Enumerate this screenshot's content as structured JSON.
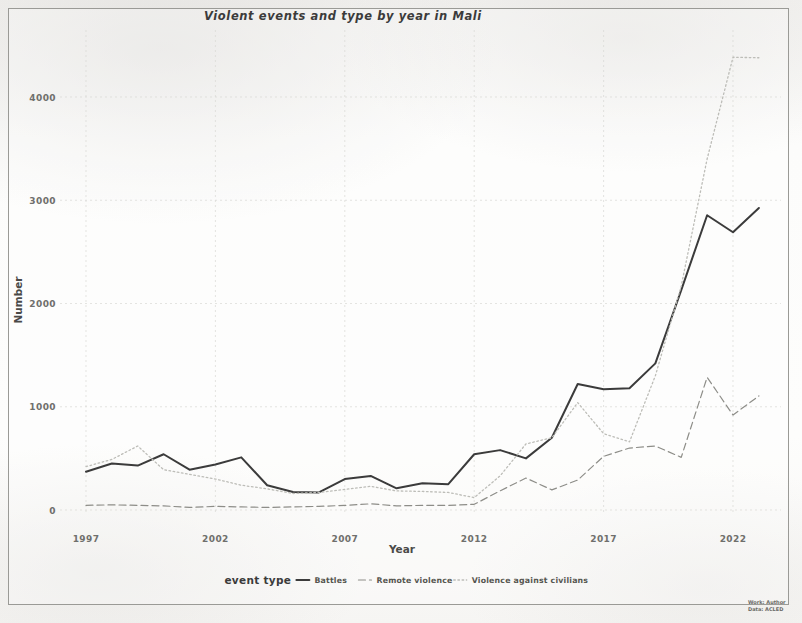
{
  "figure": {
    "title": "Violent events and type by year in Mali",
    "credit_line1": "Work: Author",
    "credit_line2": "Data: ACLED"
  },
  "axes": {
    "x_label": "Year",
    "y_label": "Number",
    "x_ticks": [
      "1997",
      "2002",
      "2007",
      "2012",
      "2017",
      "2022"
    ],
    "y_ticks": [
      "0",
      "1000",
      "2000",
      "3000",
      "4000"
    ]
  },
  "legend": {
    "title": "event type",
    "items": [
      {
        "label": "Battles",
        "color": "#3b3b3b",
        "dash": "solid"
      },
      {
        "label": "Remote violence",
        "color": "#8d8d88",
        "dash": "longdash"
      },
      {
        "label": "Violence against civilians",
        "color": "#bdbdb8",
        "dash": "dotted"
      }
    ]
  },
  "chart_data": {
    "type": "line",
    "title": "Violent events and type by year in Mali",
    "xlabel": "Year",
    "ylabel": "Number",
    "xlim": [
      1996,
      2024
    ],
    "ylim": [
      0,
      4600
    ],
    "grid": true,
    "legend_position": "bottom",
    "x": [
      1997,
      1998,
      1999,
      2000,
      2001,
      2002,
      2003,
      2004,
      2005,
      2006,
      2007,
      2008,
      2009,
      2010,
      2011,
      2012,
      2013,
      2014,
      2015,
      2016,
      2017,
      2018,
      2019,
      2020,
      2021,
      2022,
      2023
    ],
    "series": [
      {
        "name": "Battles",
        "color": "#3b3b3b",
        "dash": "solid",
        "values": [
          370,
          450,
          430,
          540,
          390,
          440,
          510,
          240,
          175,
          170,
          300,
          330,
          210,
          260,
          250,
          540,
          580,
          500,
          700,
          1220,
          1170,
          1180,
          1420,
          2130,
          2855,
          2690,
          2925
        ]
      },
      {
        "name": "Remote violence",
        "color": "#8d8d88",
        "dash": "longdash",
        "values": [
          45,
          50,
          45,
          40,
          25,
          35,
          30,
          25,
          30,
          35,
          45,
          60,
          40,
          45,
          45,
          55,
          185,
          310,
          195,
          290,
          520,
          600,
          620,
          510,
          1285,
          920,
          1105
        ]
      },
      {
        "name": "Violence against civilians",
        "color": "#bdbdb8",
        "dash": "dotted",
        "values": [
          420,
          490,
          620,
          390,
          345,
          300,
          240,
          205,
          160,
          170,
          200,
          230,
          185,
          180,
          170,
          120,
          330,
          640,
          700,
          1040,
          740,
          660,
          1300,
          2170,
          3400,
          4385,
          4380
        ]
      }
    ]
  }
}
